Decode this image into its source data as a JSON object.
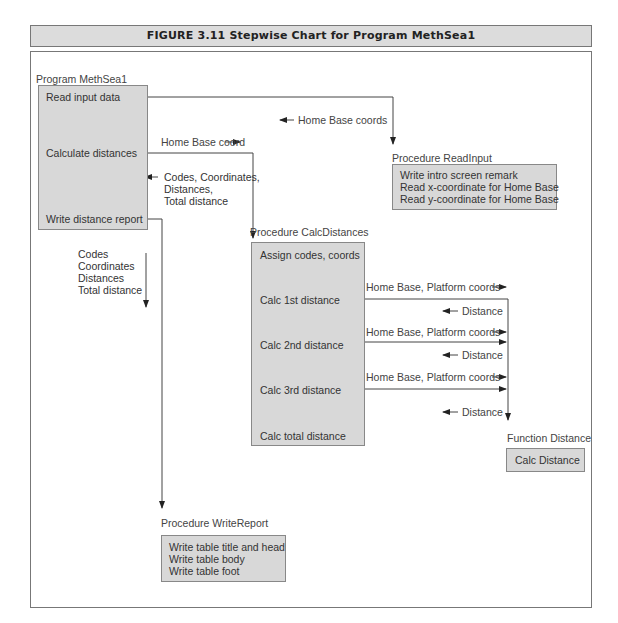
{
  "figure": {
    "title": "FIGURE 3.11     Stepwise Chart for Program MethSea1"
  },
  "main_program": {
    "label": "Program MethSea1",
    "steps": [
      "Read input data",
      "Calculate distances",
      "Write distance report"
    ]
  },
  "read_input": {
    "label": "Procedure ReadInput",
    "lines": "Write intro screen remark\nRead x-coordinate for Home Base\nRead y-coordinate for Home Base"
  },
  "calc_distances": {
    "label": "Procedure CalcDistances",
    "steps": [
      "Assign codes, coords",
      "Calc 1st distance",
      "Calc 2nd distance",
      "Calc 3rd distance",
      "Calc total distance"
    ]
  },
  "function_distance": {
    "label": "Function Distance",
    "step": "Calc Distance"
  },
  "write_report": {
    "label": "Procedure WriteReport",
    "lines": "Write table title and head\nWrite table body\nWrite table foot"
  },
  "flows": {
    "home_base_coords": "Home Base coords",
    "home_base_coord": "Home Base coord",
    "codes_return": "Codes, Coordinates,\nDistances,\nTotal distance",
    "report_params": "Codes\nCoordinates\nDistances\nTotal distance",
    "hb_platform_1": "Home Base, Platform coords",
    "hb_platform_2": "Home Base, Platform coords",
    "hb_platform_3": "Home Base, Platform coords",
    "distance_1": "Distance",
    "distance_2": "Distance",
    "distance_3": "Distance"
  }
}
